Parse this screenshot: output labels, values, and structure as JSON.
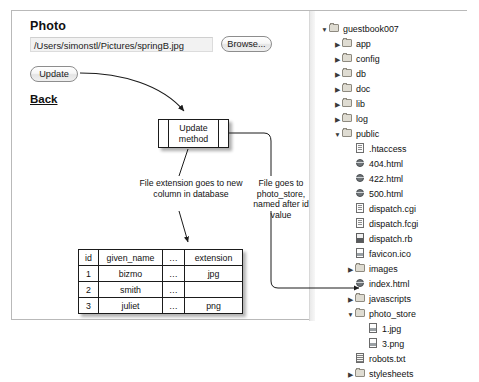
{
  "form": {
    "photo_label": "Photo",
    "path_value": "/Users/simonstl/Pictures/springB.jpg",
    "path_placeholder": "",
    "browse_label": "Browse...",
    "update_label": "Update",
    "back_label": "Back"
  },
  "diagram": {
    "method_box_line1": "Update",
    "method_box_line2": "method",
    "annotation_extension": "File extension goes to new column in database",
    "annotation_photostore": "File goes to photo_store, named after id value"
  },
  "database_table": {
    "headers": [
      "id",
      "given_name",
      "…",
      "extension"
    ],
    "rows": [
      [
        "1",
        "bizmo",
        "…",
        "jpg"
      ],
      [
        "2",
        "smith",
        "…",
        ""
      ],
      [
        "3",
        "juliet",
        "…",
        "png"
      ]
    ]
  },
  "file_tree": {
    "items": [
      {
        "label": "guestbook007",
        "level": 0,
        "twisty": "open",
        "icon": "folder-icon"
      },
      {
        "label": "app",
        "level": 1,
        "twisty": "closed",
        "icon": "folder-icon"
      },
      {
        "label": "config",
        "level": 1,
        "twisty": "closed",
        "icon": "folder-icon"
      },
      {
        "label": "db",
        "level": 1,
        "twisty": "closed",
        "icon": "folder-icon"
      },
      {
        "label": "doc",
        "level": 1,
        "twisty": "closed",
        "icon": "folder-icon"
      },
      {
        "label": "lib",
        "level": 1,
        "twisty": "closed",
        "icon": "folder-icon"
      },
      {
        "label": "log",
        "level": 1,
        "twisty": "closed",
        "icon": "folder-icon"
      },
      {
        "label": "public",
        "level": 1,
        "twisty": "open",
        "icon": "folder-icon"
      },
      {
        "label": ".htaccess",
        "level": 2,
        "twisty": "none",
        "icon": "document-icon"
      },
      {
        "label": "404.html",
        "level": 2,
        "twisty": "none",
        "icon": "web-page-icon"
      },
      {
        "label": "422.html",
        "level": 2,
        "twisty": "none",
        "icon": "web-page-icon"
      },
      {
        "label": "500.html",
        "level": 2,
        "twisty": "none",
        "icon": "web-page-icon"
      },
      {
        "label": "dispatch.cgi",
        "level": 2,
        "twisty": "none",
        "icon": "document-icon"
      },
      {
        "label": "dispatch.fcgi",
        "level": 2,
        "twisty": "none",
        "icon": "document-icon"
      },
      {
        "label": "dispatch.rb",
        "level": 2,
        "twisty": "none",
        "icon": "script-icon"
      },
      {
        "label": "favicon.ico",
        "level": 2,
        "twisty": "none",
        "icon": "image-file-icon"
      },
      {
        "label": "images",
        "level": 2,
        "twisty": "closed",
        "icon": "folder-icon"
      },
      {
        "label": "index.html",
        "level": 2,
        "twisty": "none",
        "icon": "web-page-icon"
      },
      {
        "label": "javascripts",
        "level": 2,
        "twisty": "closed",
        "icon": "folder-icon"
      },
      {
        "label": "photo_store",
        "level": 2,
        "twisty": "open",
        "icon": "folder-icon"
      },
      {
        "label": "1.jpg",
        "level": 3,
        "twisty": "none",
        "icon": "image-file-icon"
      },
      {
        "label": "3.png",
        "level": 3,
        "twisty": "none",
        "icon": "image-file-icon"
      },
      {
        "label": "robots.txt",
        "level": 2,
        "twisty": "none",
        "icon": "text-file-icon"
      },
      {
        "label": "stylesheets",
        "level": 2,
        "twisty": "closed",
        "icon": "folder-icon"
      }
    ],
    "twisty_open": "▼",
    "twisty_closed": "▶"
  }
}
